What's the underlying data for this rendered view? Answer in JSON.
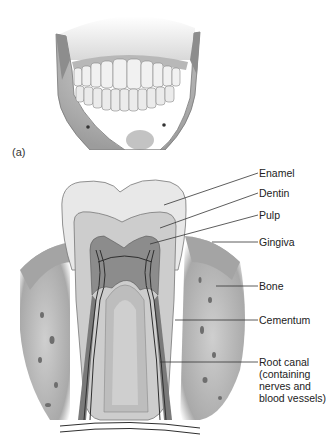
{
  "figure": {
    "panel_a": {
      "label": "(a)",
      "subject": "human jaw with upper and lower teeth, frontal view"
    },
    "panel_b": {
      "subject": "longitudinal section of a molar in bone and gingiva"
    }
  },
  "labels": [
    {
      "id": "enamel",
      "text": "Enamel"
    },
    {
      "id": "dentin",
      "text": "Dentin"
    },
    {
      "id": "pulp",
      "text": "Pulp"
    },
    {
      "id": "gingiva",
      "text": "Gingiva"
    },
    {
      "id": "bone",
      "text": "Bone"
    },
    {
      "id": "cementum",
      "text": "Cementum"
    },
    {
      "id": "root-canal",
      "text": "Root canal (containing nerves and blood vessels)"
    }
  ],
  "colors": {
    "background": "#ffffff",
    "enamel": "#e6e6e6",
    "dentin": "#cfcfcf",
    "pulp": "#8a8a8a",
    "bone": "#bdbdbd",
    "gingiva": "#a8a8a8",
    "vessels": "#3a3a3a",
    "leader_line": "#333333"
  }
}
